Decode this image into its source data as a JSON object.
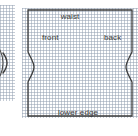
{
  "figure": {
    "type": "pattern-block-diagram",
    "labels": {
      "waist": "waist",
      "front": "front",
      "back": "back",
      "lower_edge": "lower edge"
    },
    "colors": {
      "outline": "#3c3c3c",
      "grid": "#96a3b4",
      "paper": "#ffffff",
      "text": "#3a3a3a"
    },
    "grid": {
      "cell_px": 3,
      "visible": true
    },
    "panels": [
      {
        "name": "side-panel",
        "x": 0,
        "y": 5,
        "width": 15,
        "height": 96,
        "cropped": true
      },
      {
        "name": "main-panel",
        "x": 22,
        "y": 8,
        "width": 116,
        "height": 110,
        "cropped": false
      }
    ],
    "outline_path_main": "M 28 10 L 132 10 L 132 52 C 128 60 126 63 126 67 C 126 71 128 74 132 82 L 132 116 L 28 116 L 28 82 C 32 74 34 71 34 67 C 34 63 32 60 28 52 Z",
    "outline_path_mini": "M 2 54 C 5 58 6 61 6 64 C 6 67 5 70 2 74"
  }
}
